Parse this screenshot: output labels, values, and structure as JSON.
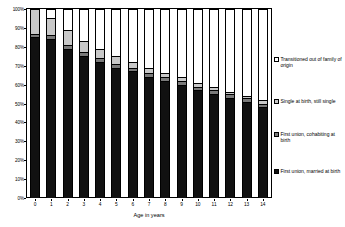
{
  "chart_data": {
    "type": "bar",
    "stacked": true,
    "stacked_mode": "percent",
    "title": "",
    "xlabel": "Age in years",
    "ylabel": "",
    "ylim": [
      0,
      100
    ],
    "ytick_labels": [
      "0%",
      "10%",
      "20%",
      "30%",
      "40%",
      "50%",
      "60%",
      "70%",
      "80%",
      "90%",
      "100%"
    ],
    "ytick_values": [
      0,
      10,
      20,
      30,
      40,
      50,
      60,
      70,
      80,
      90,
      100
    ],
    "categories": [
      "0",
      "1",
      "2",
      "3",
      "4",
      "5",
      "6",
      "7",
      "8",
      "9",
      "10",
      "11",
      "12",
      "13",
      "14"
    ],
    "grid": false,
    "legend_position": "right",
    "series": [
      {
        "name": "First union, married at birth",
        "color": "#111111",
        "values": [
          85,
          84,
          79,
          75,
          72,
          69,
          67,
          64,
          62,
          60,
          57,
          55,
          53,
          51,
          48
        ]
      },
      {
        "name": "First union, cohabiting at birth",
        "color": "#7a7a7a",
        "values": [
          2,
          2,
          2,
          2,
          2,
          2,
          2,
          2,
          2,
          2,
          2,
          2,
          2,
          2,
          2
        ]
      },
      {
        "name": "Single at birth, still single",
        "color": "#c8c8c8",
        "values": [
          13,
          9,
          8,
          6,
          5,
          4,
          3,
          3,
          2,
          2,
          2,
          2,
          1,
          1,
          2
        ]
      },
      {
        "name": "Transitioned out of family of origin",
        "color": "#ffffff",
        "values": [
          0,
          5,
          11,
          17,
          21,
          25,
          28,
          31,
          34,
          36,
          39,
          41,
          44,
          46,
          48
        ]
      }
    ],
    "legend_entries": [
      "Transitioned out of family of origin",
      "Single at birth, still single",
      "First union, cohabiting at birth",
      "First union, married at birth"
    ]
  }
}
